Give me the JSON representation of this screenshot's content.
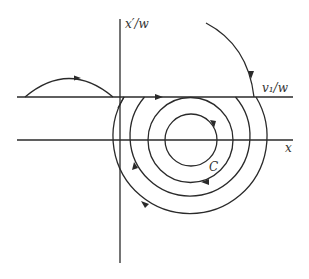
{
  "diagram": {
    "type": "phase-portrait",
    "labels": {
      "vertical_axis": "x′/w",
      "upper_line": "v₁/w",
      "horizontal_axis": "x",
      "curve": "C"
    },
    "axes": {
      "vertical": {
        "x": 120,
        "y1": 19,
        "y2": 263
      },
      "horizontal": {
        "y": 140,
        "x1": 17,
        "x2": 293
      },
      "upper_line": {
        "y": 97,
        "x1": 17,
        "x2": 293
      }
    },
    "orbits": {
      "center": [
        190,
        140
      ],
      "radii": [
        26,
        42,
        60,
        77
      ],
      "direction": "clockwise"
    },
    "colors": {
      "stroke": "#2a2a2a",
      "background": "#ffffff"
    }
  }
}
